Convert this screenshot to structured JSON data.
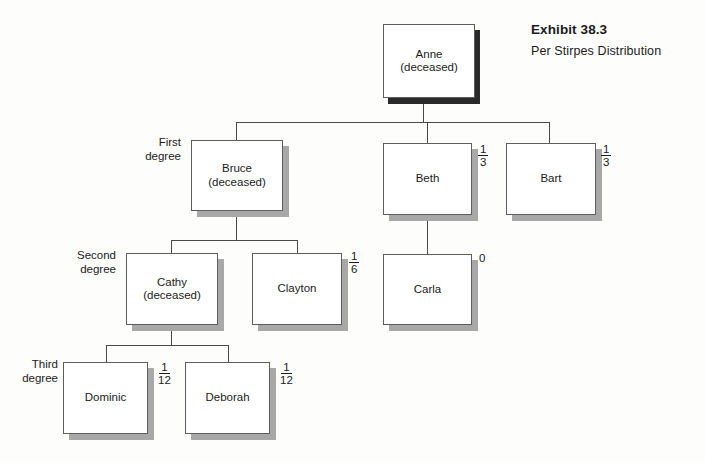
{
  "exhibit": {
    "title": "Exhibit 38.3",
    "subtitle": "Per Stirpes Distribution"
  },
  "degree_labels": [
    {
      "id": "first",
      "text": "First\ndegree"
    },
    {
      "id": "second",
      "text": "Second\ndegree"
    },
    {
      "id": "third",
      "text": "Third\ndegree"
    }
  ],
  "nodes": {
    "anne": {
      "label": "Anne\n(deceased)",
      "name": "Anne",
      "status": "deceased",
      "share": null
    },
    "bruce": {
      "label": "Bruce\n(deceased)",
      "name": "Bruce",
      "status": "deceased",
      "share": null
    },
    "beth": {
      "label": "Beth",
      "name": "Beth",
      "status": "living",
      "share": "1/3"
    },
    "bart": {
      "label": "Bart",
      "name": "Bart",
      "status": "living",
      "share": "1/3"
    },
    "cathy": {
      "label": "Cathy\n(deceased)",
      "name": "Cathy",
      "status": "deceased",
      "share": null
    },
    "clayton": {
      "label": "Clayton",
      "name": "Clayton",
      "status": "living",
      "share": "1/6"
    },
    "carla": {
      "label": "Carla",
      "name": "Carla",
      "status": "living",
      "share": "0"
    },
    "dominic": {
      "label": "Dominic",
      "name": "Dominic",
      "status": "living",
      "share": "1/12"
    },
    "deborah": {
      "label": "Deborah",
      "name": "Deborah",
      "status": "living",
      "share": "1/12"
    }
  },
  "shares": {
    "beth": {
      "numerator": "1",
      "denominator": "3"
    },
    "bart": {
      "numerator": "1",
      "denominator": "3"
    },
    "clayton": {
      "numerator": "1",
      "denominator": "6"
    },
    "carla": {
      "whole": "0"
    },
    "dominic": {
      "numerator": "1",
      "denominator": "12"
    },
    "deborah": {
      "numerator": "1",
      "denominator": "12"
    }
  },
  "colors": {
    "background": "#fdfdfc",
    "box_fill": "#ffffff",
    "box_border": "#5d5d5d",
    "connector": "#4a4a4a",
    "shadow_gray": "#a8a8a8",
    "shadow_dark": "#2a2a2a",
    "text": "#1b1b1b"
  }
}
